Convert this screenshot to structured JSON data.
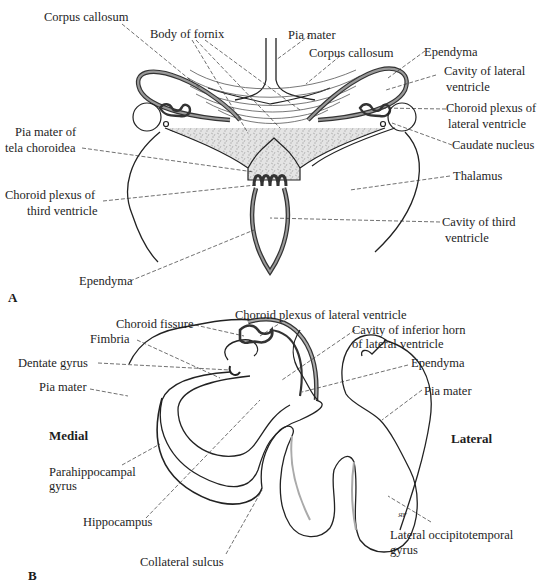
{
  "figure": {
    "panel_a": {
      "letter": "A",
      "labels": {
        "corpus_callosum_left": "Corpus callosum",
        "body_of_fornix": "Body of fornix",
        "pia_mater": "Pia mater",
        "corpus_callosum_right": "Corpus callosum",
        "ependyma_top": "Ependyma",
        "cavity_lateral_ventricle_1": "Cavity of lateral",
        "cavity_lateral_ventricle_2": "ventricle",
        "choroid_plexus_lateral_1": "Choroid plexus of",
        "choroid_plexus_lateral_2": "lateral ventricle",
        "caudate_nucleus": "Caudate nucleus",
        "pia_mater_tela_1": "Pia mater of",
        "pia_mater_tela_2": "tela choroidea",
        "choroid_plexus_third_1": "Choroid plexus of",
        "choroid_plexus_third_2": "third ventricle",
        "thalamus": "Thalamus",
        "cavity_third_1": "Cavity of third",
        "cavity_third_2": "ventricle",
        "ependyma_bottom": "Ependyma"
      }
    },
    "panel_b": {
      "letter": "B",
      "labels": {
        "choroid_fissure": "Choroid fissure",
        "choroid_plexus_lateral": "Choroid plexus of lateral ventricle",
        "cavity_inferior_horn_1": "Cavity of inferior horn",
        "cavity_inferior_horn_2": "of lateral  ventricle",
        "fimbria": "Fimbria",
        "dentate_gyrus": "Dentate gyrus",
        "ependyma": "Ependyma",
        "pia_mater_left": "Pia mater",
        "pia_mater_right": "Pia mater",
        "medial": "Medial",
        "lateral": "Lateral",
        "parahippocampal_1": "Parahippocampal",
        "parahippocampal_2": "gyrus",
        "hippocampus": "Hippocampus",
        "collateral_sulcus": "Collateral sulcus",
        "lateral_occipitotemporal_1": "Lateral occipitotemporal",
        "lateral_occipitotemporal_2": "gyrus",
        "artist_signature": "ЯF"
      }
    }
  }
}
